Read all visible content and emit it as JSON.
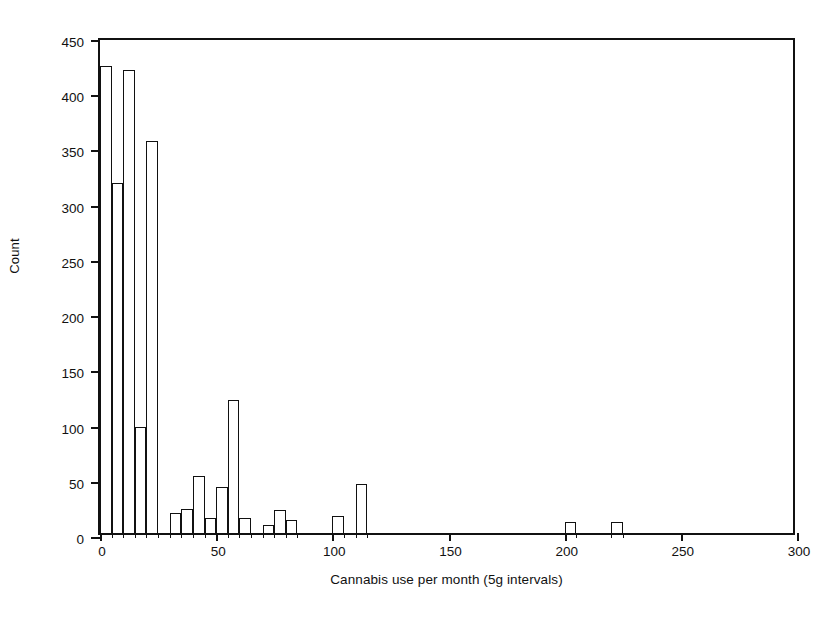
{
  "chart_data": {
    "type": "bar",
    "title": "",
    "subtitle": "",
    "xlabel": "Cannabis use per month (5g intervals)",
    "ylabel": "Count",
    "grid": false,
    "legend": false,
    "bin_width": 5,
    "xlim": [
      0,
      300
    ],
    "ylim": [
      0,
      450
    ],
    "xticks": [
      0,
      50,
      100,
      150,
      200,
      250,
      300
    ],
    "xtick_labels": [
      "0",
      "50",
      "100",
      "150",
      "200",
      "250",
      "300"
    ],
    "yticks": [
      0,
      50,
      100,
      150,
      200,
      250,
      300,
      350,
      400,
      450
    ],
    "ytick_labels": [
      "0",
      "50",
      "100",
      "150",
      "200",
      "250",
      "300",
      "350",
      "400",
      "450"
    ],
    "bins": [
      {
        "x0": 0,
        "x1": 5,
        "value": 423
      },
      {
        "x0": 5,
        "x1": 10,
        "value": 317
      },
      {
        "x0": 10,
        "x1": 15,
        "value": 419
      },
      {
        "x0": 15,
        "x1": 20,
        "value": 96
      },
      {
        "x0": 20,
        "x1": 25,
        "value": 355
      },
      {
        "x0": 25,
        "x1": 30,
        "value": 0
      },
      {
        "x0": 30,
        "x1": 35,
        "value": 18
      },
      {
        "x0": 35,
        "x1": 40,
        "value": 22
      },
      {
        "x0": 40,
        "x1": 45,
        "value": 52
      },
      {
        "x0": 45,
        "x1": 50,
        "value": 14
      },
      {
        "x0": 50,
        "x1": 55,
        "value": 42
      },
      {
        "x0": 55,
        "x1": 60,
        "value": 120
      },
      {
        "x0": 60,
        "x1": 65,
        "value": 14
      },
      {
        "x0": 65,
        "x1": 70,
        "value": 0
      },
      {
        "x0": 70,
        "x1": 75,
        "value": 7
      },
      {
        "x0": 75,
        "x1": 80,
        "value": 21
      },
      {
        "x0": 80,
        "x1": 85,
        "value": 12
      },
      {
        "x0": 85,
        "x1": 90,
        "value": 0
      },
      {
        "x0": 95,
        "x1": 100,
        "value": 0
      },
      {
        "x0": 100,
        "x1": 105,
        "value": 15
      },
      {
        "x0": 110,
        "x1": 115,
        "value": 44
      },
      {
        "x0": 200,
        "x1": 205,
        "value": 10
      },
      {
        "x0": 220,
        "x1": 225,
        "value": 10
      }
    ],
    "x_minor_ticks": [
      0,
      5,
      10,
      15,
      20,
      25,
      30,
      35,
      40,
      45,
      50,
      55,
      60,
      65,
      70,
      75,
      80,
      85,
      100,
      105,
      110,
      115,
      200,
      205,
      220,
      225
    ]
  },
  "axes": {
    "x_title": "Cannabis use per month (5g intervals)",
    "y_title": "Count"
  }
}
